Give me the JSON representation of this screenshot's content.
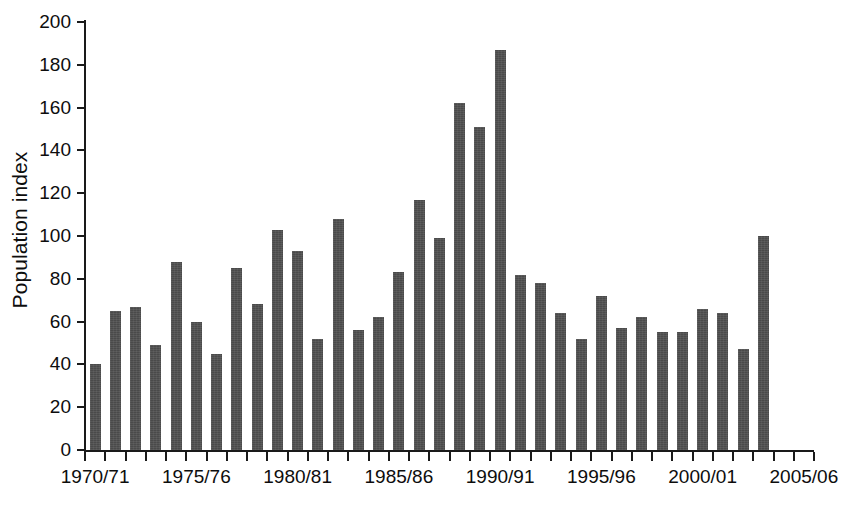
{
  "chart_data": {
    "type": "bar",
    "title": "",
    "xlabel": "",
    "ylabel": "Population index",
    "ylim": [
      0,
      200
    ],
    "ytick_step": 20,
    "yticks": [
      0,
      20,
      40,
      60,
      80,
      100,
      120,
      140,
      160,
      180,
      200
    ],
    "grid": false,
    "legend": null,
    "bar_color": "#4a4a4a",
    "axis_color": "#1a1a1a",
    "xtick_labels_shown": [
      "1970/71",
      "1975/76",
      "1980/81",
      "1985/86",
      "1990/91",
      "1995/96",
      "2000/01",
      "2005/06"
    ],
    "xtick_label_indices": [
      0,
      5,
      10,
      15,
      20,
      25,
      30,
      35
    ],
    "categories": [
      "1970/71",
      "1971/72",
      "1972/73",
      "1973/74",
      "1974/75",
      "1975/76",
      "1976/77",
      "1977/78",
      "1978/79",
      "1979/80",
      "1980/81",
      "1981/82",
      "1982/83",
      "1983/84",
      "1984/85",
      "1985/86",
      "1986/87",
      "1987/88",
      "1988/89",
      "1989/90",
      "1990/91",
      "1991/92",
      "1992/93",
      "1993/94",
      "1994/95",
      "1995/96",
      "1996/97",
      "1997/98",
      "1998/99",
      "1999/00",
      "2000/01",
      "2001/02",
      "2002/03",
      "2003/04",
      "2004/05",
      "2005/06"
    ],
    "values": [
      40,
      65,
      67,
      49,
      88,
      60,
      45,
      85,
      68,
      103,
      93,
      52,
      108,
      56,
      62,
      83,
      117,
      99,
      162,
      151,
      187,
      82,
      78,
      64,
      52,
      72,
      57,
      62,
      55,
      55,
      66,
      64,
      47,
      100,
      null,
      null
    ]
  }
}
